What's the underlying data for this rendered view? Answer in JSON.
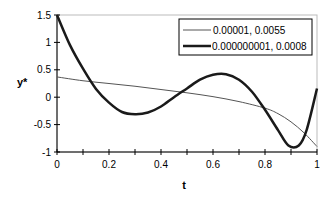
{
  "chart_data": {
    "type": "line",
    "title": "",
    "xlabel": "t",
    "ylabel": "y*",
    "xlim": [
      0,
      1
    ],
    "ylim": [
      -1,
      1.5
    ],
    "x_ticks": [
      "0",
      "0.2",
      "0.4",
      "0.6",
      "0.8",
      "1"
    ],
    "y_ticks": [
      "1.5",
      "1",
      "0.5",
      "0",
      "-0.5",
      "-1"
    ],
    "grid": false,
    "legend_position": "upper right",
    "series": [
      {
        "name": "0.00001,  0.0055",
        "color": "#555555",
        "line_width": 1,
        "x": [
          0,
          0.1,
          0.2,
          0.3,
          0.4,
          0.5,
          0.6,
          0.7,
          0.8,
          0.85,
          0.9,
          0.95,
          1.0
        ],
        "y": [
          0.37,
          0.3,
          0.25,
          0.2,
          0.14,
          0.08,
          0.01,
          -0.08,
          -0.2,
          -0.3,
          -0.45,
          -0.65,
          -0.9
        ]
      },
      {
        "name": "0.000000001, 0.0008",
        "color": "#1a1a1a",
        "line_width": 2.5,
        "x": [
          0,
          0.05,
          0.1,
          0.15,
          0.2,
          0.25,
          0.3,
          0.35,
          0.4,
          0.45,
          0.5,
          0.55,
          0.6,
          0.65,
          0.7,
          0.75,
          0.8,
          0.85,
          0.89,
          0.93,
          0.96,
          1.0
        ],
        "y": [
          1.5,
          0.95,
          0.52,
          0.15,
          -0.1,
          -0.27,
          -0.31,
          -0.28,
          -0.17,
          0.0,
          0.16,
          0.32,
          0.41,
          0.42,
          0.32,
          0.1,
          -0.23,
          -0.6,
          -0.88,
          -0.88,
          -0.6,
          0.16
        ]
      }
    ]
  }
}
